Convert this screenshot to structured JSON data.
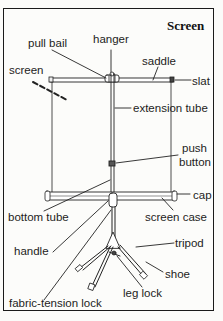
{
  "title": "Screen",
  "labels": {
    "pull_bail": "pull bail",
    "hanger": "hanger",
    "saddle": "saddle",
    "screen": "screen",
    "slat": "slat",
    "extension_tube": "extension tube",
    "push_button": "push button",
    "push_line1": "push",
    "push_line2": "button",
    "bottom_tube": "bottom tube",
    "cap": "cap",
    "screen_case": "screen case",
    "handle": "handle",
    "tripod": "tripod",
    "shoe": "shoe",
    "leg_lock": "leg lock",
    "fabric_tension_lock": "fabric-tension lock"
  }
}
